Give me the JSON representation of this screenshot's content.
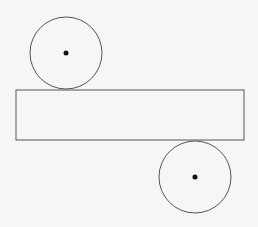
{
  "diagram": {
    "type": "cylinder-net",
    "background": "#f6f6f5",
    "stroke_color": "#555555",
    "dot_color": "#111111",
    "top_circle": {
      "cx": 66,
      "cy": 53,
      "r": 36,
      "center_dot_r": 2.5
    },
    "rectangle": {
      "x": 16,
      "y": 90,
      "width": 228,
      "height": 50
    },
    "bottom_circle": {
      "cx": 195,
      "cy": 177,
      "r": 36,
      "center_dot_r": 2.5
    }
  }
}
